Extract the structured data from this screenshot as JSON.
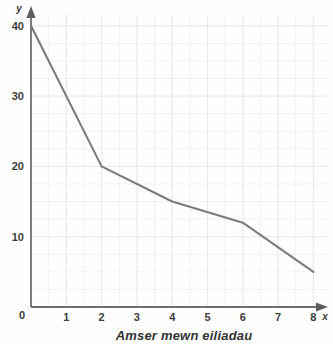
{
  "chart_data": {
    "type": "line",
    "title": "",
    "xlabel": "Amser mewn eiliadau",
    "ylabel": "y",
    "x_axis_symbol": "x",
    "y_axis_symbol": "y",
    "origin_label": "0",
    "x": [
      0,
      2,
      4,
      6,
      8
    ],
    "values": [
      40,
      20,
      15,
      12,
      5
    ],
    "series": [
      {
        "name": "",
        "x": [
          0,
          2,
          4,
          6,
          8
        ],
        "values": [
          40,
          20,
          15,
          12,
          5
        ]
      }
    ],
    "xlim": [
      0,
      8.4
    ],
    "ylim": [
      0,
      41.5
    ],
    "x_ticks": [
      "1",
      "2",
      "3",
      "4",
      "5",
      "6",
      "7",
      "8"
    ],
    "x_tick_values": [
      1,
      2,
      3,
      4,
      5,
      6,
      7,
      8
    ],
    "y_ticks": [
      "10",
      "20",
      "30",
      "40"
    ],
    "y_tick_values": [
      10,
      20,
      30,
      40
    ],
    "grid": true,
    "grid_minor_step_x": 0.5,
    "grid_minor_step_y": 2.5,
    "legend": "none",
    "line_color": "#7b7b7b",
    "axis_color": "#6e6e6e",
    "grid_color": "#f1f1f4",
    "background_color": "#fefefe"
  }
}
